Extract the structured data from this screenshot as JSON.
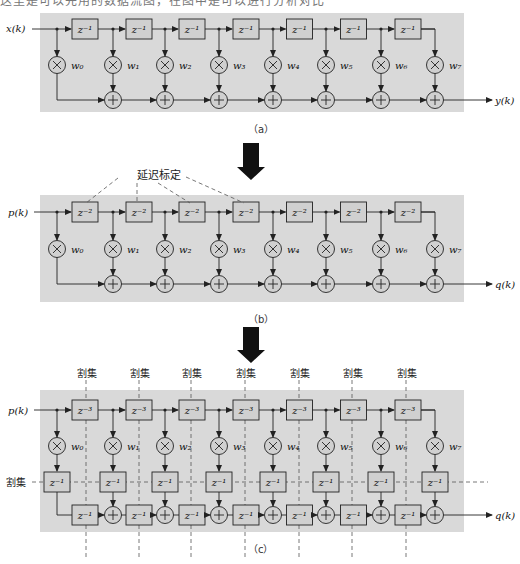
{
  "top_cut_text": "这里是可以先用的数据流图，在图中是可以进行分析对比",
  "colors": {
    "panel_bg": "#d9d9d9",
    "line": "#222222",
    "box_fill": "#d0d0d0",
    "dash": "#555555",
    "arrow": "#111111"
  },
  "panel_a": {
    "caption": "（a）",
    "input_label": "x(k)",
    "output_label": "y(k)",
    "delay_label": "z⁻¹",
    "weights": [
      "w₀",
      "w₁",
      "w₂",
      "w₃",
      "w₄",
      "w₅",
      "w₆",
      "w₇"
    ]
  },
  "panel_b": {
    "caption": "（b）",
    "input_label": "p(k)",
    "output_label": "q(k)",
    "delay_label": "z⁻²",
    "annotation": "延迟标定",
    "weights": [
      "w₀",
      "w₁",
      "w₂",
      "w₃",
      "w₄",
      "w₅",
      "w₆",
      "w₇"
    ]
  },
  "panel_c": {
    "caption": "（c）",
    "input_label": "p(k)",
    "output_label": "q(k)",
    "delay_label": "z⁻³",
    "inner_delay_label": "z⁻¹",
    "cutset_label": "割集",
    "cutset_labels": [
      "割集",
      "割集",
      "割集",
      "割集",
      "割集",
      "割集",
      "割集"
    ],
    "weights": [
      "w₀",
      "w₁",
      "w₂",
      "w₃",
      "w₄",
      "w₅",
      "w₆",
      "w₇"
    ]
  }
}
